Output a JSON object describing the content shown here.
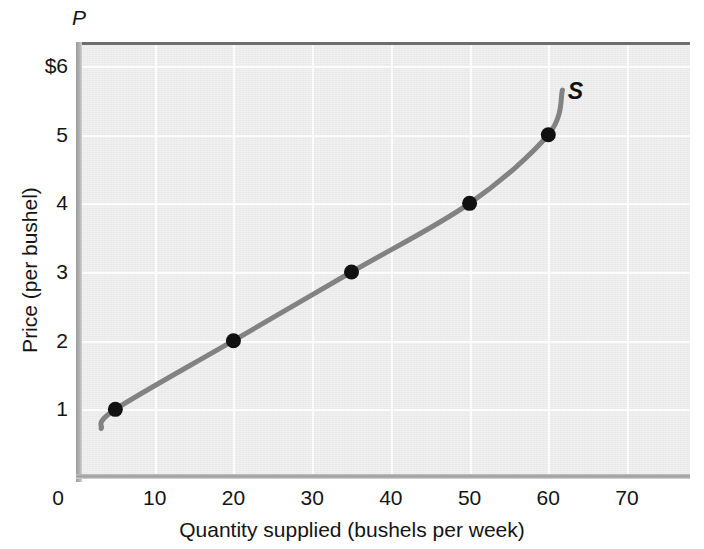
{
  "chart_data": {
    "type": "line",
    "title": "",
    "subtitle": "",
    "xlabel": "Quantity supplied (bushels per week)",
    "ylabel": "Price (per bushel)",
    "y_axis_symbol": "P",
    "curve_label": "S",
    "xlim": [
      0,
      78
    ],
    "ylim": [
      0,
      6.35
    ],
    "grid": true,
    "legend_position": "inline-right",
    "xticks": [
      0,
      10,
      20,
      30,
      40,
      50,
      60,
      70
    ],
    "xtick_labels": [
      "0",
      "10",
      "20",
      "30",
      "40",
      "50",
      "60",
      "70"
    ],
    "yticks": [
      1,
      2,
      3,
      4,
      5,
      6
    ],
    "ytick_labels": [
      "1",
      "2",
      "3",
      "4",
      "5",
      "$6"
    ],
    "series": [
      {
        "name": "S",
        "type": "supply-curve",
        "x": [
          5,
          20,
          35,
          50,
          60
        ],
        "y": [
          1,
          2,
          3,
          4,
          5
        ],
        "markers": true,
        "marker_color": "#111111",
        "line_color": "#828282",
        "line_width": 5,
        "curve_extent_x": [
          3.2,
          61.8
        ],
        "curve_extent_y": [
          0.72,
          5.65
        ]
      }
    ],
    "annotations": [
      {
        "text": "S",
        "x": 63.5,
        "y": 5.62
      }
    ],
    "colors": {
      "plot_background": "#e9e9e9",
      "gridline": "#fbfbfb",
      "curve": "#828282",
      "marker": "#111111",
      "text": "#141414",
      "page_background": "#ffffff"
    }
  }
}
